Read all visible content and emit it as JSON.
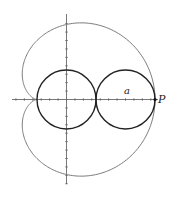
{
  "diagram": {
    "labels": {
      "radius": "a",
      "point": "P"
    },
    "colors": {
      "cardioid": "#7a7a7a",
      "circles": "#222222",
      "axes": "#555555",
      "point": "#111111"
    },
    "elements": {
      "fixed_circle": "circle of radius a centered at origin",
      "rolling_circle": "circle of radius a tangent to fixed circle, tracing point P",
      "curve": "cardioid traced by P"
    }
  }
}
